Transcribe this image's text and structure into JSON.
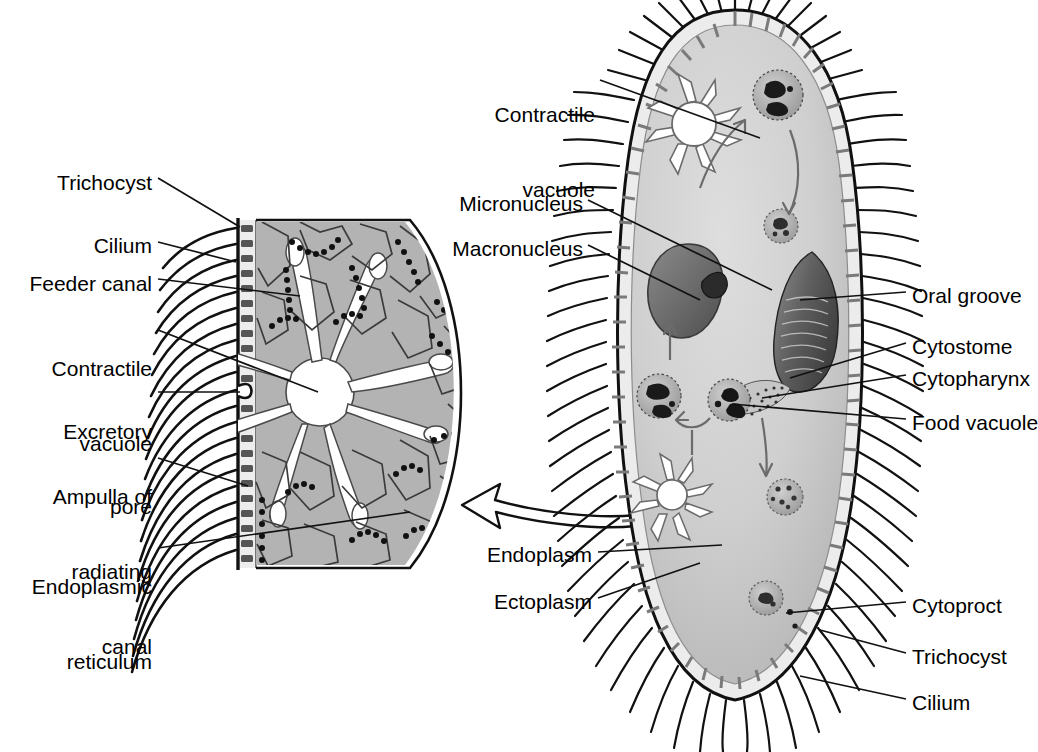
{
  "figure": {
    "type": "biological-diagram"
  },
  "colors": {
    "ink": "#000000",
    "cytoplasm_light": "#d2d2d2",
    "cytoplasm_mid": "#bdbdbd",
    "cytoplasm_dark": "#a8a8a8",
    "pellicle": "#e8e8e8",
    "macronucleus": "#6e6e6e",
    "micronucleus": "#2b2b2b",
    "inset_fill": "#b3b3b3",
    "background": "#ffffff"
  },
  "inset_labels": [
    {
      "id": "trichocyst",
      "text": "Trichocyst",
      "lines": [
        "Trichocyst"
      ],
      "x": 152,
      "y": 170,
      "align": "right"
    },
    {
      "id": "cilium",
      "text": "Cilium",
      "lines": [
        "Cilium"
      ],
      "x": 152,
      "y": 233,
      "align": "right"
    },
    {
      "id": "feeder-canal",
      "text": "Feeder canal",
      "lines": [
        "Feeder canal"
      ],
      "x": 152,
      "y": 271,
      "align": "right"
    },
    {
      "id": "contractile-vacuole",
      "text": "Contractile vacuole",
      "lines": [
        "Contractile",
        "vacuole"
      ],
      "x": 152,
      "y": 312,
      "align": "right"
    },
    {
      "id": "excretory-pore",
      "text": "Excretory pore",
      "lines": [
        "Excretory",
        "pore"
      ],
      "x": 152,
      "y": 375,
      "align": "right"
    },
    {
      "id": "ampulla",
      "text": "Ampulla of radiating canal",
      "lines": [
        "Ampulla of",
        "radiating",
        "canal"
      ],
      "x": 152,
      "y": 443,
      "align": "right"
    },
    {
      "id": "endoplasmic-reticulum",
      "text": "Endoplasmic reticulum",
      "lines": [
        "Endoplasmic",
        "reticulum"
      ],
      "x": 152,
      "y": 530,
      "align": "right"
    }
  ],
  "cell_labels_left": [
    {
      "id": "contractile-vacuole-cell",
      "text": "Contractile vacuole",
      "lines": [
        "Contractile",
        "vacuole"
      ],
      "x": 595,
      "y": 57,
      "align": "right"
    },
    {
      "id": "micronucleus",
      "text": "Micronucleus",
      "lines": [
        "Micronucleus"
      ],
      "x": 583,
      "y": 193,
      "align": "right"
    },
    {
      "id": "macronucleus",
      "text": "Macronucleus",
      "lines": [
        "Macronucleus"
      ],
      "x": 583,
      "y": 238,
      "align": "right"
    },
    {
      "id": "endoplasm",
      "text": "Endoplasm",
      "lines": [
        "Endoplasm"
      ],
      "x": 592,
      "y": 544,
      "align": "right"
    },
    {
      "id": "ectoplasm",
      "text": "Ectoplasm",
      "lines": [
        "Ectoplasm"
      ],
      "x": 592,
      "y": 591,
      "align": "right"
    }
  ],
  "cell_labels_right": [
    {
      "id": "oral-groove",
      "text": "Oral groove",
      "x": 912,
      "y": 285,
      "align": "left"
    },
    {
      "id": "cytostome",
      "text": "Cytostome",
      "x": 912,
      "y": 336,
      "align": "left"
    },
    {
      "id": "cytopharynx",
      "text": "Cytopharynx",
      "x": 912,
      "y": 368,
      "align": "left"
    },
    {
      "id": "food-vacuole",
      "text": "Food vacuole",
      "x": 912,
      "y": 412,
      "align": "left"
    },
    {
      "id": "cytoproct",
      "text": "Cytoproct",
      "x": 912,
      "y": 595,
      "align": "left"
    },
    {
      "id": "trichocyst-r",
      "text": "Trichocyst",
      "x": 912,
      "y": 646,
      "align": "left"
    },
    {
      "id": "cilium-r",
      "text": "Cilium",
      "x": 912,
      "y": 692,
      "align": "left"
    }
  ],
  "organelles": {
    "contractile_vacuole_top": {
      "name": "Contractile vacuole (upper, radiating canals)",
      "cx": 692,
      "cy": 124,
      "r": 23,
      "rays": 8
    },
    "contractile_vacuole_bottom": {
      "name": "Contractile vacuole (lower, radiating canals)",
      "cx": 671,
      "cy": 495,
      "r": 16,
      "rays": 8
    },
    "macronucleus": {
      "name": "Macronucleus",
      "cx": 683,
      "cy": 290,
      "rx": 42,
      "ry": 48
    },
    "micronucleus": {
      "name": "Micronucleus",
      "cx": 713,
      "cy": 280,
      "r": 10
    },
    "food_vacuoles": [
      {
        "id": "fv1",
        "cx": 775,
        "cy": 95,
        "r": 26,
        "stage": "newly formed, dark contents"
      },
      {
        "id": "fv2",
        "cx": 779,
        "cy": 225,
        "r": 17,
        "stage": "digesting"
      },
      {
        "id": "fv3",
        "cx": 730,
        "cy": 400,
        "r": 22,
        "stage": "forming at cytopharynx"
      },
      {
        "id": "fv4",
        "cx": 660,
        "cy": 395,
        "r": 22,
        "stage": "spent, returning"
      },
      {
        "id": "fv5",
        "cx": 781,
        "cy": 496,
        "r": 18,
        "stage": "late digestion"
      },
      {
        "id": "fv6",
        "cx": 765,
        "cy": 598,
        "r": 17,
        "stage": "at cytoproct"
      }
    ],
    "oral_groove": {
      "name": "Oral groove / buccal cavity",
      "cx": 800,
      "cy": 320
    },
    "cytopharynx": {
      "name": "Cytopharynx",
      "cx": 760,
      "cy": 380
    },
    "cytoproct": {
      "name": "Cytoproct",
      "cx": 782,
      "cy": 610
    }
  },
  "pointer_arrow": {
    "name": "magnification-pointer",
    "description": "curved outlined arrow pointing from the cell body to the inset detail"
  },
  "cyclosis_arrows": [
    {
      "from": "contractile vacuole area",
      "to": "food vacuole fv1",
      "dir": "up-right"
    },
    {
      "from": "fv1",
      "to": "fv2",
      "dir": "down"
    },
    {
      "from": "fv3",
      "to": "fv5",
      "dir": "down"
    },
    {
      "from": "fv4",
      "to": "macronucleus region",
      "dir": "up"
    },
    {
      "from": "fv3",
      "to": "fv4",
      "dir": "left"
    }
  ]
}
